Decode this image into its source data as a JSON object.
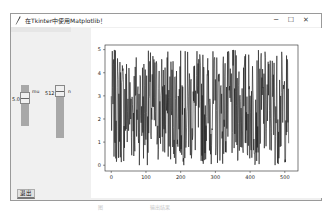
{
  "window": {
    "title": "在Tkinter中使用Matplotlib！",
    "controls": {
      "minimize": "─",
      "maximize": "☐",
      "close": "✕"
    }
  },
  "sliders": [
    {
      "name": "mu",
      "label": "mu",
      "value": "5.0"
    },
    {
      "name": "n",
      "label": "n",
      "value": "512"
    }
  ],
  "buttons": {
    "quit": "退出"
  },
  "caption": {
    "left": "图",
    "right": "输出结果"
  },
  "chart_data": {
    "type": "line",
    "title": "",
    "xlabel": "",
    "ylabel": "",
    "xlim": [
      -18,
      538
    ],
    "ylim": [
      -0.25,
      5.2
    ],
    "xticks": [
      "0",
      "100",
      "200",
      "300",
      "400",
      "500"
    ],
    "yticks": [
      "0",
      "1",
      "2",
      "3",
      "4",
      "5"
    ],
    "grid": false,
    "line_color": "#1a1a1a",
    "series": [
      {
        "name": "uniform(0, mu) random samples",
        "n_points": 512,
        "min": 0,
        "max": 5,
        "seed": 7
      }
    ]
  }
}
